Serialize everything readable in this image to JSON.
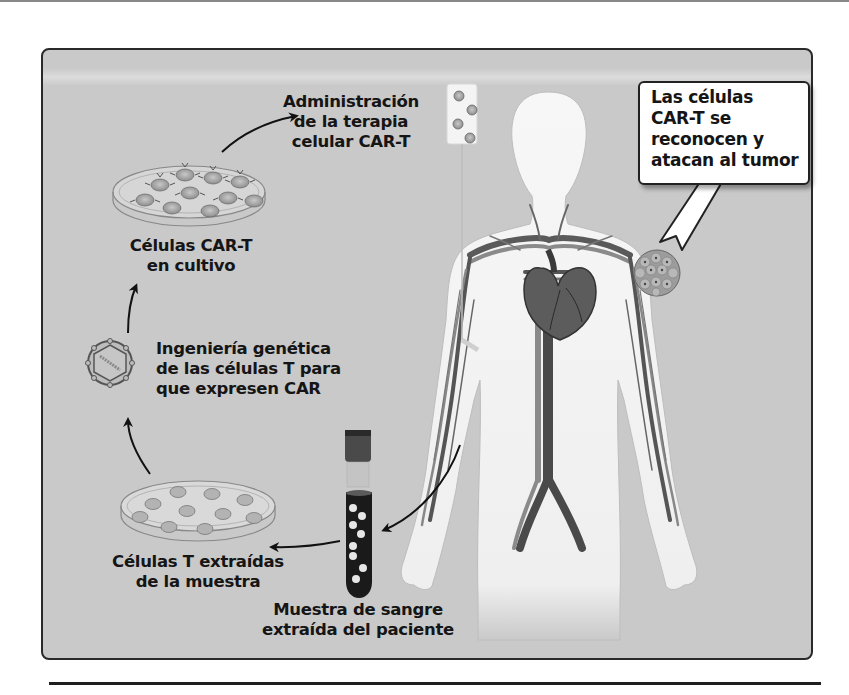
{
  "figure": {
    "steps": [
      {
        "id": "blood-sample",
        "lines": [
          "Muestra de sangre",
          "extraída del paciente"
        ]
      },
      {
        "id": "t-cells-extracted",
        "lines": [
          "Células T extraídas",
          "de la muestra"
        ]
      },
      {
        "id": "genetic-engineering",
        "lines": [
          "Ingeniería genética",
          "de las células T para",
          "que expresen CAR"
        ]
      },
      {
        "id": "car-t-culture",
        "lines": [
          "Células CAR-T",
          "en cultivo"
        ]
      },
      {
        "id": "administration",
        "lines": [
          "Administración",
          "de la terapia",
          "celular CAR-T"
        ]
      },
      {
        "id": "tumor-attack",
        "lines": [
          "Las células",
          "CAR-T se",
          "reconocen y",
          "atacan al tumor"
        ]
      }
    ],
    "colors": {
      "panel_bg": "#c9c9c9",
      "panel_border": "#2a2a2a",
      "body_fill": "#f2f2f2",
      "vessel_dark": "#4a4a4a",
      "vessel_mid": "#7a7a7a",
      "blood_tube": "#1a1a1a",
      "cell_fill": "#a8a8a8",
      "callout_bg": "#ffffff"
    }
  }
}
